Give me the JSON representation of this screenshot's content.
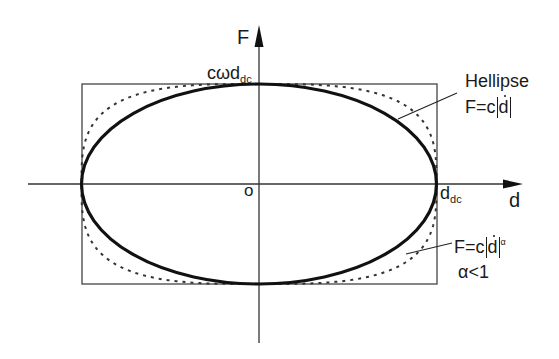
{
  "diagram": {
    "axes": {
      "x_label": "d",
      "y_label": "F",
      "origin_label": "o"
    },
    "annotations": {
      "top_value": {
        "main": "cωd",
        "sub": "dc"
      },
      "right_value": {
        "main": "d",
        "sub": "dc"
      },
      "ellipse_label": {
        "line1": "Hellipse",
        "line2_prefix": "F=c",
        "line2_var": "d"
      },
      "dashed_label": {
        "line1_prefix": "F=c",
        "line1_var": "d",
        "line1_exp": "α",
        "line2": "α<1"
      }
    },
    "curves": [
      {
        "name": "Hellipse",
        "style": "solid-thick",
        "equation": "F=c|ḋ|"
      },
      {
        "name": "power-law",
        "style": "dashed",
        "equation": "F=c|ḋ|^α",
        "condition": "α<1"
      }
    ],
    "colors": {
      "ink": "#1a1a1a",
      "frame": "#444444"
    }
  }
}
